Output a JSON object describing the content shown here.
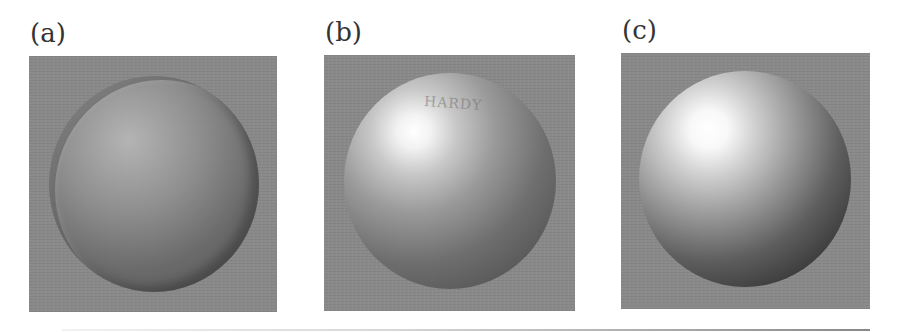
{
  "figure": {
    "panels": [
      {
        "label": "(a)",
        "description": "dome-shaped sphere with rim, matte shading"
      },
      {
        "label": "(b)",
        "description": "glossy sphere with specular highlight and faint embossed text",
        "embossed_text": "HARDY"
      },
      {
        "label": "(c)",
        "description": "smooth shaded sphere with bright highlight"
      }
    ],
    "colors": {
      "panel_background": "#8a8a8a",
      "page_background": "#ffffff"
    }
  }
}
